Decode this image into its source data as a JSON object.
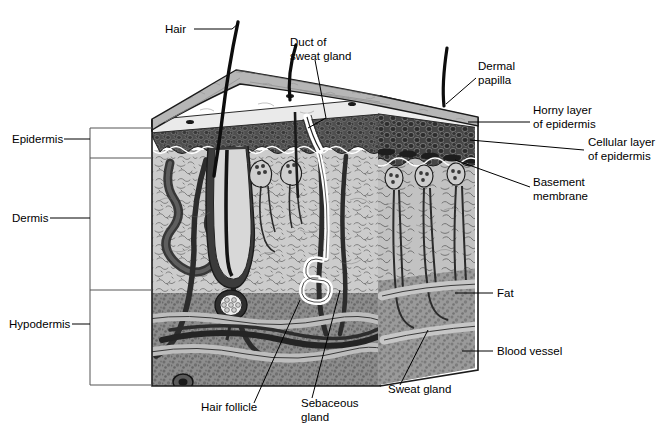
{
  "figure": {
    "type": "anatomical-diagram",
    "background": "#ffffff",
    "ink": "#000000"
  },
  "bracket_labels": [
    {
      "id": "epidermis",
      "text": "Epidermis",
      "x": 12,
      "y": 143,
      "leader_x1": 64,
      "leader_x2": 90,
      "band_top": 128,
      "band_bottom": 158
    },
    {
      "id": "dermis",
      "text": "Dermis",
      "x": 12,
      "y": 222,
      "leader_x1": 50,
      "leader_x2": 90,
      "band_top": 158,
      "band_bottom": 290
    },
    {
      "id": "hypodermis",
      "text": "Hypodermis",
      "x": 9,
      "y": 328,
      "leader_x1": 72,
      "leader_x2": 90,
      "band_top": 290,
      "band_bottom": 385
    }
  ],
  "callouts": [
    {
      "id": "hair",
      "lines": [
        "Hair"
      ],
      "x": 186,
      "y": 33,
      "anchor": "end",
      "leader": "M194,29 L232,29 L238,24"
    },
    {
      "id": "duct-of-sweat-gland",
      "lines": [
        "Duct of",
        "sweat gland"
      ],
      "x": 290,
      "y": 46,
      "anchor": "start",
      "leader": "M315,60 L326,118 L308,128"
    },
    {
      "id": "dermal-papilla",
      "lines": [
        "Dermal",
        "papilla"
      ],
      "x": 478,
      "y": 70,
      "anchor": "start",
      "leader": "M476,78 L446,104"
    },
    {
      "id": "horny-layer-of-epidermis",
      "lines": [
        "Horny layer",
        "of epidermis"
      ],
      "x": 533,
      "y": 114,
      "anchor": "start",
      "leader": "M530,122 L468,122"
    },
    {
      "id": "cellular-layer-of-epidermis",
      "lines": [
        "Cellular layer",
        "of epidermis"
      ],
      "x": 588,
      "y": 146,
      "anchor": "start",
      "leader": "M584,150 L470,140"
    },
    {
      "id": "basement-membrane",
      "lines": [
        "Basement",
        "membrane"
      ],
      "x": 533,
      "y": 186,
      "anchor": "start",
      "leader": "M530,187 L455,160"
    },
    {
      "id": "fat",
      "lines": [
        "Fat"
      ],
      "x": 497,
      "y": 297,
      "anchor": "start",
      "leader": "M493,293 L455,293"
    },
    {
      "id": "blood-vessel",
      "lines": [
        "Blood vessel"
      ],
      "x": 497,
      "y": 355,
      "anchor": "start",
      "leader": "M493,351 L462,351"
    },
    {
      "id": "sweat-gland",
      "lines": [
        "Sweat gland"
      ],
      "x": 388,
      "y": 393,
      "anchor": "start",
      "leader": "M400,385 L428,330"
    },
    {
      "id": "sebaceous-gland",
      "lines": [
        "Sebaceous",
        "gland"
      ],
      "x": 301,
      "y": 407,
      "anchor": "start",
      "leader": "M312,398 L340,290"
    },
    {
      "id": "hair-follicle",
      "lines": [
        "Hair follicle"
      ],
      "x": 201,
      "y": 411,
      "anchor": "start",
      "leader": "M254,403 L300,300"
    }
  ],
  "layers": [
    {
      "id": "surface-top",
      "name": "skin surface (top face)",
      "color": "#b5b5b5"
    },
    {
      "id": "horny-layer",
      "name": "horny layer of epidermis",
      "color": "#e9e9e9"
    },
    {
      "id": "cellular-layer",
      "name": "cellular layer of epidermis",
      "color": "#4a4a4a"
    },
    {
      "id": "dermis-layer",
      "name": "dermis",
      "color": "#c9c9c9"
    },
    {
      "id": "fat-layer",
      "name": "fat / hypodermis",
      "color": "#8a8a8a"
    },
    {
      "id": "blood-vessel",
      "name": "blood vessel",
      "color": "#b0b0b0"
    },
    {
      "id": "sweat-duct",
      "name": "sweat duct",
      "color": "#ffffff"
    },
    {
      "id": "hair-shaft",
      "name": "hair shaft",
      "color": "#111111"
    }
  ]
}
